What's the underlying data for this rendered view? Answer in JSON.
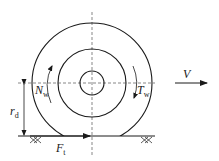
{
  "diagram": {
    "colors": {
      "stroke": "#1a1a1a",
      "dashed": "#555555",
      "background": "#ffffff"
    },
    "labels": {
      "velocity": {
        "main": "V",
        "sub": ""
      },
      "normal_moment": {
        "main": "N",
        "sub": "w"
      },
      "torque": {
        "main": "T",
        "sub": "w"
      },
      "radius": {
        "main": "r",
        "sub": "d"
      },
      "traction_force": {
        "main": "F",
        "sub": "t"
      }
    },
    "geometry": {
      "center": [
        92,
        83
      ],
      "outer_radius": 60,
      "middle_radius": 34,
      "inner_radius": 12,
      "ground_y": 136
    }
  }
}
